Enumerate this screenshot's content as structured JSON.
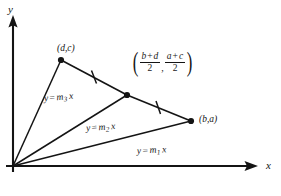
{
  "figure": {
    "type": "geometry-diagram",
    "background_color": "#ffffff",
    "ink_color": "#141414",
    "axes": {
      "x_label": "x",
      "y_label": "y",
      "origin_label": ""
    },
    "points": [
      {
        "id": "origin",
        "label": "",
        "x": 13,
        "y": 166
      },
      {
        "id": "vertex-dc",
        "label": "(d,c)",
        "x": 61,
        "y": 60
      },
      {
        "id": "midpoint",
        "label": "midpoint",
        "x": 127,
        "y": 95
      },
      {
        "id": "vertex-ba",
        "label": "(b,a)",
        "x": 191,
        "y": 121
      }
    ],
    "midpoint_label": {
      "open_paren": "(",
      "first_numerator_left": "b",
      "first_numerator_op": "+",
      "first_numerator_right": "d",
      "first_denominator": "2",
      "separator": ",",
      "second_numerator_left": "a",
      "second_numerator_op": "+",
      "second_numerator_right": "c",
      "second_denominator": "2",
      "close_paren": ")"
    },
    "lines": [
      {
        "id": "line-m1",
        "label_y": "y",
        "label_eq": "=",
        "label_m": "m",
        "label_sub": "1",
        "label_x": "x"
      },
      {
        "id": "line-m2",
        "label_y": "y",
        "label_eq": "=",
        "label_m": "m",
        "label_sub": "2",
        "label_x": "x"
      },
      {
        "id": "line-m3",
        "label_y": "y",
        "label_eq": "=",
        "label_m": "m",
        "label_sub": "3",
        "label_x": "x"
      }
    ],
    "tick_marks": 2,
    "caption": ""
  }
}
